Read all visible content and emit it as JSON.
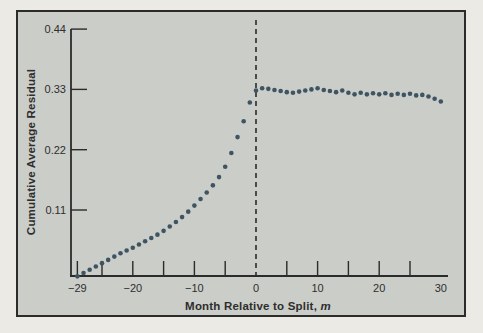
{
  "colors": {
    "page_bg": "#ebeae5",
    "panel_bg": "#cbcdc8",
    "frame": "#2b2b2b",
    "axis": "#2b2b2b",
    "dot": "#3f5463",
    "text": "#2e2e2e"
  },
  "chart_data": {
    "type": "scatter",
    "title": "",
    "xlabel": "Month Relative to Split, ",
    "xlabel_italic": "m",
    "ylabel": "Cumulative Average Residual",
    "xlim": [
      -29,
      31
    ],
    "ylim": [
      -0.01,
      0.44
    ],
    "grid": false,
    "legend": "none",
    "y_ticks": [
      {
        "value": 0.44,
        "label": "0.44"
      },
      {
        "value": 0.33,
        "label": "0.33"
      },
      {
        "value": 0.22,
        "label": "0.22"
      },
      {
        "value": 0.11,
        "label": "0.11"
      }
    ],
    "x_tick_marks": [
      -29,
      -25,
      -20,
      -15,
      -10,
      -5,
      5,
      10,
      15,
      20,
      25
    ],
    "x_tick_labels": [
      {
        "value": -29,
        "label": "−29"
      },
      {
        "value": -20,
        "label": "−20"
      },
      {
        "value": -10,
        "label": "−10"
      },
      {
        "value": 0,
        "label": "0"
      },
      {
        "value": 10,
        "label": "10"
      },
      {
        "value": 20,
        "label": "20"
      },
      {
        "value": 30,
        "label": "30"
      }
    ],
    "split_line_x": 0,
    "series": [
      {
        "name": "Cumulative Average Residual",
        "points": [
          [
            -29,
            -0.011
          ],
          [
            -28,
            -0.005
          ],
          [
            -27,
            0.001
          ],
          [
            -26,
            0.007
          ],
          [
            -25,
            0.013
          ],
          [
            -24,
            0.019
          ],
          [
            -23,
            0.025
          ],
          [
            -22,
            0.031
          ],
          [
            -21,
            0.036
          ],
          [
            -20,
            0.041
          ],
          [
            -19,
            0.047
          ],
          [
            -18,
            0.053
          ],
          [
            -17,
            0.059
          ],
          [
            -16,
            0.065
          ],
          [
            -15,
            0.072
          ],
          [
            -14,
            0.08
          ],
          [
            -13,
            0.088
          ],
          [
            -12,
            0.097
          ],
          [
            -11,
            0.107
          ],
          [
            -10,
            0.118
          ],
          [
            -9,
            0.13
          ],
          [
            -8,
            0.142
          ],
          [
            -7,
            0.155
          ],
          [
            -6,
            0.17
          ],
          [
            -5,
            0.189
          ],
          [
            -4,
            0.214
          ],
          [
            -3,
            0.243
          ],
          [
            -2,
            0.272
          ],
          [
            -1,
            0.306
          ],
          [
            0,
            0.328
          ],
          [
            1,
            0.332
          ],
          [
            2,
            0.331
          ],
          [
            3,
            0.329
          ],
          [
            4,
            0.327
          ],
          [
            5,
            0.325
          ],
          [
            6,
            0.324
          ],
          [
            7,
            0.326
          ],
          [
            8,
            0.328
          ],
          [
            9,
            0.33
          ],
          [
            10,
            0.332
          ],
          [
            11,
            0.329
          ],
          [
            12,
            0.327
          ],
          [
            13,
            0.325
          ],
          [
            14,
            0.328
          ],
          [
            15,
            0.324
          ],
          [
            16,
            0.321
          ],
          [
            17,
            0.324
          ],
          [
            18,
            0.321
          ],
          [
            19,
            0.323
          ],
          [
            20,
            0.321
          ],
          [
            21,
            0.323
          ],
          [
            22,
            0.32
          ],
          [
            23,
            0.322
          ],
          [
            24,
            0.32
          ],
          [
            25,
            0.322
          ],
          [
            26,
            0.319
          ],
          [
            27,
            0.32
          ],
          [
            28,
            0.317
          ],
          [
            29,
            0.313
          ],
          [
            30,
            0.308
          ]
        ]
      }
    ]
  }
}
